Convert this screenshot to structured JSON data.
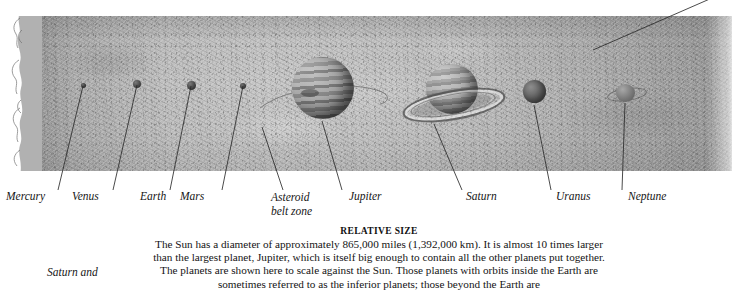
{
  "figure": {
    "title": "RELATIVE SIZE",
    "body": "The Sun has a diameter of approximately 865,000 miles (1,392,000 km). It is almost 10 times larger than the largest planet, Jupiter, which is itself big enough to contain all the other planets put together. The planets are shown here to scale against the Sun. Those planets with orbits inside the Earth are sometimes referred to as the inferior planets; those beyond the Earth are",
    "side_note": "Saturn and"
  },
  "labels": [
    {
      "id": "mercury",
      "text": "Mercury",
      "text2": ""
    },
    {
      "id": "venus",
      "text": "Venus",
      "text2": ""
    },
    {
      "id": "earth",
      "text": "Earth",
      "text2": ""
    },
    {
      "id": "mars",
      "text": "Mars",
      "text2": ""
    },
    {
      "id": "asteroid",
      "text": "Asteroid",
      "text2": "belt zone"
    },
    {
      "id": "jupiter",
      "text": "Jupiter",
      "text2": ""
    },
    {
      "id": "saturn",
      "text": "Saturn",
      "text2": ""
    },
    {
      "id": "uranus",
      "text": "Uranus",
      "text2": ""
    },
    {
      "id": "neptune",
      "text": "Neptune",
      "text2": ""
    }
  ],
  "colors": {
    "background": "#ffffff",
    "sun_band": "#c9c9c9",
    "ink": "#161616",
    "leader_line": "#2b2b2b"
  }
}
